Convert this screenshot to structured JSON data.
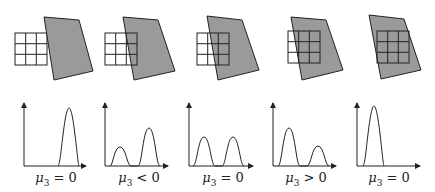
{
  "figure": {
    "colors": {
      "region_fill": "#9a9a9a",
      "stroke": "#222222",
      "background": "#ffffff"
    },
    "panels": [
      {
        "id": 1,
        "label": {
          "symbol": "μ",
          "subscript": "3",
          "relation": "=",
          "value": "0"
        },
        "window_position": "fully outside dark region",
        "histogram": "single peak at high intensity"
      },
      {
        "id": 2,
        "label": {
          "symbol": "μ",
          "subscript": "3",
          "relation": "<",
          "value": "0"
        },
        "window_position": "one column over dark region",
        "histogram": "small low peak, larger high peak"
      },
      {
        "id": 3,
        "label": {
          "symbol": "μ",
          "subscript": "3",
          "relation": "=",
          "value": "0"
        },
        "window_position": "half over dark region",
        "histogram": "two equal peaks"
      },
      {
        "id": 4,
        "label": {
          "symbol": "μ",
          "subscript": "3",
          "relation": ">",
          "value": "0"
        },
        "window_position": "two columns over dark region",
        "histogram": "large low peak, smaller high peak"
      },
      {
        "id": 5,
        "label": {
          "symbol": "μ",
          "subscript": "3",
          "relation": "=",
          "value": "0"
        },
        "window_position": "fully inside dark region",
        "histogram": "single peak at low intensity"
      }
    ]
  }
}
